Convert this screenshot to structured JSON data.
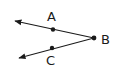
{
  "diagram": {
    "type": "angle",
    "title": "",
    "vertex": {
      "label": "B",
      "x": 94,
      "y": 38
    },
    "points": [
      {
        "label": "A",
        "x": 53,
        "y": 29
      },
      {
        "label": "C",
        "x": 52,
        "y": 48
      }
    ],
    "rays": [
      {
        "from": "B",
        "through": "A",
        "tip": {
          "x": 14,
          "y": 21
        }
      },
      {
        "from": "B",
        "through": "C",
        "tip": {
          "x": 18,
          "y": 58
        }
      }
    ],
    "labels": {
      "A": "A",
      "B": "B",
      "C": "C"
    },
    "colors": {
      "stroke": "#1a1a1a",
      "background": "#ffffff"
    }
  }
}
